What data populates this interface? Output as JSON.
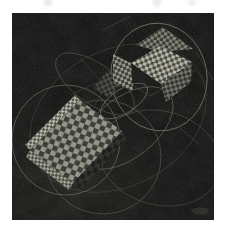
{
  "page": {
    "width": 227,
    "height": 231,
    "background": "#ffffff"
  },
  "scene": {
    "alt": "grayscale-raytraced-render-two-checkered-boxes-with-orbit-curves",
    "canvas": {
      "x": 12,
      "y": 13,
      "width": 202,
      "height": 207,
      "fill": "#0d0d0d"
    },
    "palette": {
      "margin": "#ffffff",
      "background_dark": "#0d0d0d",
      "checker_bright": "#b5b5a7",
      "checker_mid": "#8f8f82",
      "checker_dark_cell": "#2f2f2a",
      "curve_light": "#7f7f6f",
      "curve_faint": "#45453d"
    },
    "vignette": {
      "cx": 70,
      "cy": 180,
      "rx": 95,
      "ry": 75,
      "color": "#23231d",
      "opacity": 0.5
    },
    "top_smudges": [
      {
        "cx": 48,
        "cy": 2,
        "r": 4.5,
        "fill": "#dadada",
        "opacity": 0.55
      },
      {
        "cx": 157,
        "cy": 2,
        "r": 4.5,
        "fill": "#dadada",
        "opacity": 0.5
      },
      {
        "cx": 192,
        "cy": 2,
        "r": 3.8,
        "fill": "#dedede",
        "opacity": 0.45
      }
    ],
    "orbits": [
      {
        "cx": 159,
        "cy": 77,
        "rx": 48,
        "ry": 54,
        "rotate": -10,
        "stroke": "#7f7f6f",
        "opacity": 0.85,
        "width": 0.8
      },
      {
        "cx": 66,
        "cy": 140,
        "rx": 54,
        "ry": 55,
        "rotate": 0,
        "stroke": "#6c6c5d",
        "opacity": 0.8,
        "width": 0.8
      },
      {
        "cx": 103,
        "cy": 157,
        "rx": 58,
        "ry": 57,
        "rotate": 0,
        "stroke": "#5d5d51",
        "opacity": 0.7,
        "width": 0.8
      },
      {
        "cx": 126,
        "cy": 128,
        "rx": 55,
        "ry": 30,
        "rotate": -38,
        "stroke": "#6e6e60",
        "opacity": 0.7,
        "width": 0.8
      },
      {
        "cx": 124,
        "cy": 101,
        "rx": 27,
        "ry": 12,
        "rotate": -33,
        "stroke": "#7a7a6b",
        "opacity": 0.75,
        "width": 0.8
      },
      {
        "cx": 95,
        "cy": 84,
        "rx": 46,
        "ry": 20,
        "rotate": 35,
        "stroke": "#575750",
        "opacity": 0.65,
        "width": 0.8
      },
      {
        "cx": 160,
        "cy": 158,
        "rx": 62,
        "ry": 47,
        "rotate": 15,
        "stroke": "#4e4e45",
        "opacity": 0.6,
        "width": 0.8
      },
      {
        "cx": 118,
        "cy": 118,
        "rx": 93,
        "ry": 68,
        "rotate": -28,
        "stroke": "#45453d",
        "opacity": 0.55,
        "width": 0.8
      }
    ],
    "mesh_lines": [
      {
        "x1": 108,
        "y1": 70,
        "x2": 150,
        "y2": 96
      },
      {
        "x1": 150,
        "y1": 96,
        "x2": 196,
        "y2": 70
      },
      {
        "x1": 103,
        "y1": 30,
        "x2": 131,
        "y2": 16
      },
      {
        "x1": 196,
        "y1": 52,
        "x2": 213,
        "y2": 80
      },
      {
        "x1": 80,
        "y1": 58,
        "x2": 118,
        "y2": 100
      },
      {
        "x1": 70,
        "y1": 95,
        "x2": 125,
        "y2": 70
      },
      {
        "x1": 95,
        "y1": 105,
        "x2": 121,
        "y2": 56
      },
      {
        "x1": 168,
        "y1": 118,
        "x2": 199,
        "y2": 144
      }
    ],
    "mesh_style": {
      "stroke": "#3e3e37",
      "opacity": 0.8,
      "width": 0.7
    },
    "faces": [
      {
        "name": "connector-flap",
        "points": "93,88 108,70 124,80 109,98",
        "cell": 3.2,
        "rotate": 20,
        "light": "#4a4a42",
        "dark": "#191915",
        "opacity": 0.85
      },
      {
        "name": "large-box-front-shadow",
        "points": "73,183 122,131 126,139 78,192",
        "cell": 5.0,
        "rotate": 22,
        "light": "#23231e",
        "dark": "#101010",
        "opacity": 1
      },
      {
        "name": "large-box-top-edge",
        "points": "30,150 80,100 75,95 25,145",
        "cell": 2.6,
        "rotate": 52,
        "light": "#b3b3a4",
        "dark": "#505046",
        "opacity": 1
      },
      {
        "name": "large-box-left-edge",
        "points": "30,150 73,183 69,190 26,157",
        "cell": 2.6,
        "rotate": 52,
        "light": "#9c9c8e",
        "dark": "#44443c",
        "opacity": 1
      },
      {
        "name": "large-box-top-face",
        "points": "30,150 80,100 122,131 73,183",
        "cell": 5.2,
        "rotate": 22,
        "light": "#8f8f82",
        "dark": "#2f2f2a",
        "opacity": 1
      },
      {
        "name": "small-box-back-face",
        "points": "136,45 163,27 193,49 160,52",
        "cell": 3.1,
        "rotate": 10,
        "light": "#7d7d71",
        "dark": "#2b2b26",
        "opacity": 1
      },
      {
        "name": "small-box-left-face",
        "points": "113,54 131,63 133,91 113,83",
        "cell": 3.0,
        "rotate": -18,
        "light": "#8f8f83",
        "dark": "#2d2d28",
        "opacity": 1
      },
      {
        "name": "small-box-right-face",
        "points": "161,84 192,62 191,82 166,102",
        "cell": 3.2,
        "rotate": 30,
        "light": "#6b6b60",
        "dark": "#232321",
        "opacity": 1
      },
      {
        "name": "small-box-top-face",
        "points": "131,63 160,46 192,62 161,84",
        "cell": 3.4,
        "rotate": 22,
        "light": "#b5b5a7",
        "dark": "#3d3d36",
        "opacity": 1
      }
    ],
    "corner_blob": {
      "cx": 200,
      "cy": 211,
      "rx": 9,
      "ry": 3.5,
      "fill": "#262621",
      "opacity": 0.7
    },
    "grain_opacity": 0.22,
    "mottle_opacity": 0.13
  }
}
